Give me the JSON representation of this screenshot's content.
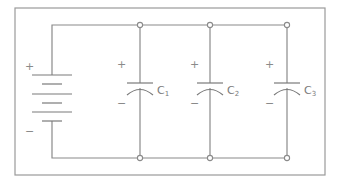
{
  "diagram": {
    "type": "circuit-schematic",
    "battery": {
      "positive_sign": "+",
      "negative_sign": "−"
    },
    "capacitors": [
      {
        "label": "C",
        "subscript": "1",
        "positive_sign": "+",
        "negative_sign": "−"
      },
      {
        "label": "C",
        "subscript": "2",
        "positive_sign": "+",
        "negative_sign": "−"
      },
      {
        "label": "C",
        "subscript": "3",
        "positive_sign": "+",
        "negative_sign": "−"
      }
    ],
    "colors": {
      "wire": "#8a8a8a",
      "frame": "#9a9a9a",
      "background": "#ffffff"
    }
  }
}
